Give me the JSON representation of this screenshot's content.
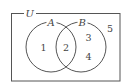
{
  "diagram": {
    "type": "venn",
    "universe": {
      "label": "U",
      "box": {
        "x": 11,
        "y": 13,
        "width": 109,
        "height": 68
      }
    },
    "sets": [
      {
        "label": "A",
        "cx": 51,
        "cy": 47,
        "r": 25
      },
      {
        "label": "B",
        "cx": 81,
        "cy": 47,
        "r": 25
      }
    ],
    "regions": [
      {
        "label": "1",
        "description": "A only",
        "x": 43,
        "y": 50
      },
      {
        "label": "2",
        "description": "A and B",
        "x": 66,
        "y": 50
      },
      {
        "label": "3",
        "description": "B only",
        "x": 88,
        "y": 40
      },
      {
        "label": "4",
        "description": "B only",
        "x": 88,
        "y": 59
      },
      {
        "label": "5",
        "description": "outside A and B",
        "x": 110,
        "y": 31
      }
    ],
    "colors": {
      "stroke": "#555555",
      "text": "#444444",
      "background": "#ffffff"
    }
  }
}
